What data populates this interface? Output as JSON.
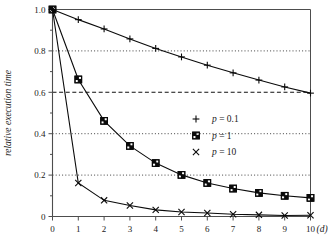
{
  "chart_data": {
    "type": "line",
    "title": "",
    "xlabel": "(d)",
    "ylabel": "relative execution time",
    "xlim": [
      0,
      10
    ],
    "ylim": [
      0,
      1.0
    ],
    "grid": true,
    "legend_position": "center-right",
    "x": [
      0,
      1,
      2,
      3,
      4,
      5,
      6,
      7,
      8,
      9,
      10
    ],
    "xticks": [
      "0",
      "1",
      "2",
      "3",
      "4",
      "5",
      "6",
      "7",
      "8",
      "9",
      "10"
    ],
    "yticks": [
      "0",
      "0.2",
      "0.4",
      "0.6",
      "0.8",
      "1.0"
    ],
    "ytick_values": [
      0,
      0.2,
      0.4,
      0.6,
      0.8,
      1.0
    ],
    "yminor_values": [
      0.1,
      0.3,
      0.5,
      0.7,
      0.9
    ],
    "gridlines_dotted": [
      0.2,
      0.4,
      0.8
    ],
    "gridlines_dashed": [
      0.6
    ],
    "series": [
      {
        "name": "p = 0.1",
        "marker": "plus",
        "values": [
          1.0,
          0.951,
          0.906,
          0.858,
          0.812,
          0.771,
          0.731,
          0.694,
          0.659,
          0.626,
          0.596
        ]
      },
      {
        "name": "p = 1",
        "marker": "square-grid",
        "values": [
          1.0,
          0.662,
          0.462,
          0.341,
          0.258,
          0.201,
          0.162,
          0.135,
          0.114,
          0.1,
          0.09
        ]
      },
      {
        "name": "p = 10",
        "marker": "cross",
        "values": [
          1.0,
          0.162,
          0.078,
          0.053,
          0.032,
          0.022,
          0.017,
          0.011,
          0.008,
          0.005,
          0.006
        ]
      }
    ]
  },
  "axes": {
    "y_title": "relative execution time",
    "x_unit_label": "(d)"
  },
  "legend": {
    "entries": [
      {
        "symbol": "+",
        "var": "p",
        "eq": " = 0.1",
        "full": "p = 0.1"
      },
      {
        "symbol": "⊞",
        "var": "p",
        "eq": " = 1",
        "full": "p = 1"
      },
      {
        "symbol": "×",
        "var": "p",
        "eq": " = 10",
        "full": "p = 10"
      }
    ]
  },
  "colors": {
    "line": "#0a0a0a",
    "frame": "#4d4d4d",
    "grid": "#2b2b2b",
    "background": "#ffffff",
    "text": "#1a1a1a"
  }
}
